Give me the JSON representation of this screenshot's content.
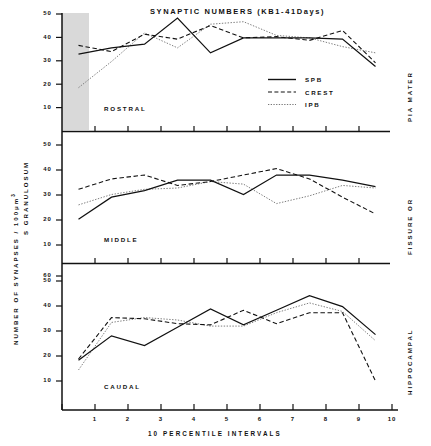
{
  "figure": {
    "title": "SYNAPTIC NUMBERS (KB1-41Days)",
    "xaxis_title": "10  PERCENTILE  INTERVALS",
    "yaxis_title_main": "NUMBER  OF  SYNAPSES  /  100",
    "yaxis_title_units": "μm",
    "yaxis_title_exponent": "3",
    "yaxis_title_secondary": "S  GRANULOSUM",
    "right_label_top": "PIA  MATER",
    "right_label_middle": "FISSURE  OR",
    "right_label_bottom": "HIPPOCAMPAL"
  },
  "legend": {
    "position": "top-panel-right",
    "items": [
      {
        "label": "SPB",
        "style": "solid",
        "color": "#111111"
      },
      {
        "label": "CREST",
        "style": "dashed",
        "color": "#111111"
      },
      {
        "label": "IPB",
        "style": "dotted",
        "color": "#777777"
      }
    ]
  },
  "panels": [
    {
      "name": "ROSTRAL",
      "label": "ROSTRAL"
    },
    {
      "name": "MIDDLE",
      "label": "MIDDLE"
    },
    {
      "name": "CAUDAL",
      "label": "CAUDAL"
    }
  ],
  "xticks": [
    "1",
    "2",
    "3",
    "4",
    "5",
    "6",
    "7",
    "8",
    "9",
    "10"
  ],
  "yticks_rostral": [
    "10",
    "20",
    "30",
    "40",
    "50"
  ],
  "yticks_middle": [
    "10",
    "20",
    "30",
    "40",
    "50"
  ],
  "yticks_caudal": [
    "10",
    "20",
    "30",
    "40",
    "50",
    "60"
  ],
  "chart_data": [
    {
      "type": "line",
      "panel": "ROSTRAL",
      "title": "SYNAPTIC NUMBERS (KB1-41Days)",
      "xlabel": "10 PERCENTILE INTERVALS",
      "ylabel": "NUMBER OF SYNAPSES / 100 μm3",
      "x": [
        1,
        2,
        3,
        4,
        5,
        6,
        7,
        8,
        9,
        10
      ],
      "xlim": [
        0.5,
        10.5
      ],
      "ylim": [
        5,
        52
      ],
      "grid": false,
      "series": [
        {
          "name": "SPB",
          "style": "solid",
          "values": [
            35.5,
            38.0,
            39.5,
            50.0,
            36.0,
            42.0,
            42.0,
            42.0,
            41.5,
            30.5
          ]
        },
        {
          "name": "CREST",
          "style": "dashed",
          "values": [
            39.0,
            36.5,
            43.5,
            41.5,
            47.0,
            42.0,
            42.5,
            41.0,
            45.0,
            32.0
          ]
        },
        {
          "name": "IPB",
          "style": "dotted",
          "values": [
            22.0,
            32.5,
            44.0,
            38.0,
            47.5,
            48.5,
            43.0,
            42.0,
            38.5,
            36.0
          ]
        }
      ]
    },
    {
      "type": "line",
      "panel": "MIDDLE",
      "xlabel": "10 PERCENTILE INTERVALS",
      "ylabel": "S GRANULOSUM",
      "x": [
        1,
        2,
        3,
        4,
        5,
        6,
        7,
        8,
        9,
        10
      ],
      "xlim": [
        0.5,
        10.5
      ],
      "ylim": [
        5,
        52
      ],
      "grid": false,
      "series": [
        {
          "name": "SPB",
          "style": "solid",
          "values": [
            21.5,
            30.0,
            32.5,
            36.5,
            36.5,
            31.0,
            38.5,
            38.5,
            36.5,
            34.0
          ]
        },
        {
          "name": "CREST",
          "style": "dashed",
          "values": [
            33.0,
            37.0,
            38.5,
            34.5,
            36.0,
            38.5,
            41.0,
            37.0,
            30.0,
            23.5
          ]
        },
        {
          "name": "IPB",
          "style": "dotted",
          "values": [
            27.0,
            31.0,
            33.0,
            33.5,
            36.0,
            35.0,
            27.5,
            30.5,
            34.5,
            33.5
          ]
        }
      ]
    },
    {
      "type": "line",
      "panel": "CAUDAL",
      "xlabel": "10 PERCENTILE INTERVALS",
      "ylabel": "NUMBER OF SYNAPSES / 100 μm3",
      "x": [
        1,
        2,
        3,
        4,
        5,
        6,
        7,
        8,
        9,
        10
      ],
      "xlim": [
        0.5,
        10.5
      ],
      "ylim": [
        5,
        62
      ],
      "grid": false,
      "series": [
        {
          "name": "SPB",
          "style": "solid",
          "values": [
            25.0,
            35.0,
            31.0,
            38.5,
            46.0,
            39.5,
            45.5,
            51.5,
            47.0,
            35.5
          ]
        },
        {
          "name": "CREST",
          "style": "dashed",
          "values": [
            25.5,
            42.5,
            42.0,
            40.0,
            39.5,
            45.5,
            40.0,
            44.5,
            44.5,
            16.5
          ]
        },
        {
          "name": "IPB",
          "style": "dotted",
          "values": [
            21.0,
            40.5,
            42.5,
            41.5,
            39.0,
            39.0,
            44.5,
            48.5,
            45.0,
            33.0
          ]
        }
      ]
    }
  ]
}
